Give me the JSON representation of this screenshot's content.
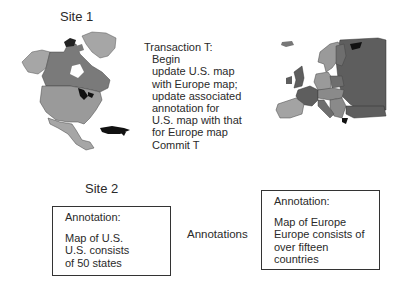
{
  "site1": {
    "label": "Site 1",
    "map": {
      "name": "North America map",
      "colors": {
        "light": "#a6a6a6",
        "mid": "#8a8a8a",
        "dark": "#6e6e6e",
        "black": "#111111"
      }
    }
  },
  "transaction": {
    "title": "Transaction T:",
    "lines": [
      "Begin",
      "update U.S. map",
      "with Europe map;",
      "update associated",
      "annotation for",
      "U.S. map with that",
      "for Europe map",
      "Commit T"
    ]
  },
  "europe_map": {
    "name": "Europe map",
    "colors": {
      "light": "#a3a3a3",
      "mid": "#858585",
      "dark": "#606060",
      "black": "#111111"
    }
  },
  "site2": {
    "label": "Site 2"
  },
  "annotations_label": "Annotations",
  "annotation_us": {
    "title": "Annotation:",
    "lines": [
      "Map of U.S.",
      "U.S. consists",
      "of 50 states"
    ]
  },
  "annotation_europe": {
    "title": "Annotation:",
    "lines": [
      "Map of Europe",
      "Europe consists of",
      "over fifteen",
      "countries"
    ]
  }
}
